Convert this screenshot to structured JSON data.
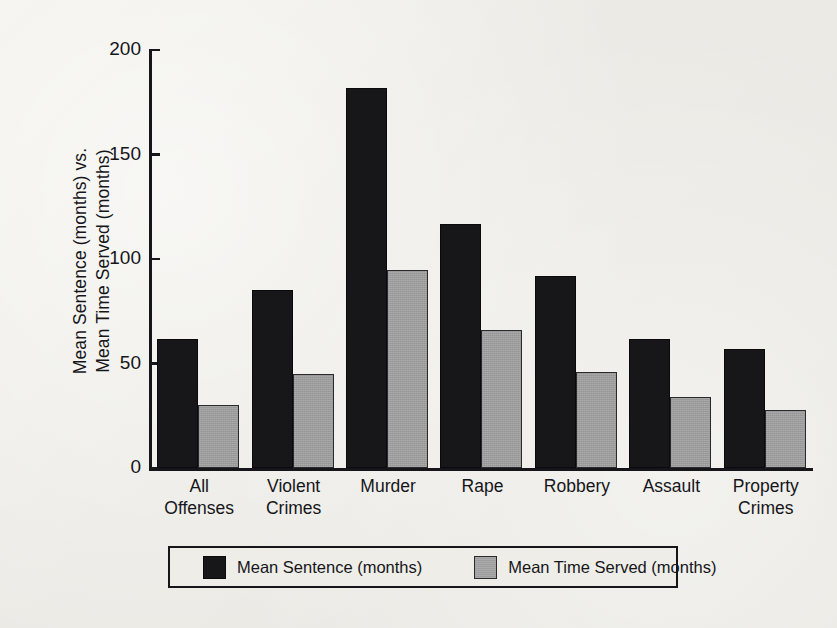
{
  "chart_data": {
    "type": "bar",
    "title": "",
    "xlabel": "",
    "ylabel_line1": "Mean Sentence (months) vs.",
    "ylabel_line2": "Mean Time Served (months)",
    "ylim": [
      0,
      200
    ],
    "ytick_labels": [
      "200",
      "150",
      "100",
      "50",
      "0"
    ],
    "ytick_values": [
      200,
      150,
      100,
      50,
      0
    ],
    "grid": false,
    "legend_position": "bottom",
    "categories": [
      "All Offenses",
      "Violent Crimes",
      "Murder",
      "Rape",
      "Robbery",
      "Assault",
      "Property Crimes"
    ],
    "category_lines": [
      [
        "All",
        "Offenses"
      ],
      [
        "Violent",
        "Crimes"
      ],
      [
        "Murder",
        ""
      ],
      [
        "Rape",
        ""
      ],
      [
        "Robbery",
        ""
      ],
      [
        "Assault",
        ""
      ],
      [
        "Property",
        "Crimes"
      ]
    ],
    "series": [
      {
        "name": "Mean Sentence (months)",
        "color": "#17171a",
        "values": [
          61,
          84,
          181,
          116,
          91,
          61,
          56
        ]
      },
      {
        "name": "Mean Time Served (months)",
        "color": "#9d9d9d",
        "values": [
          29,
          44,
          94,
          65,
          45,
          33,
          27
        ]
      }
    ]
  },
  "legend": {
    "items": [
      {
        "label": "Mean Sentence (months)",
        "swatch": "dark-swatch"
      },
      {
        "label": "Mean Time Served (months)",
        "swatch": "light-swatch"
      }
    ]
  },
  "colors": {
    "series_dark": "#17171a",
    "series_light": "#9d9d9d",
    "axis": "#15151a",
    "background": "#efeeea"
  }
}
